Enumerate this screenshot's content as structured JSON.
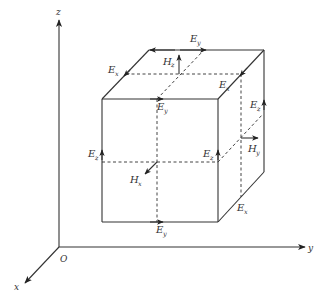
{
  "diagram": {
    "axes": {
      "origin": "O",
      "x": "x",
      "y": "y",
      "z": "z"
    },
    "labels": {
      "top_back_Ey": {
        "main": "E",
        "sub": "y"
      },
      "top_left_Ex": {
        "main": "E",
        "sub": "x"
      },
      "top_Hz": {
        "main": "H",
        "sub": "z"
      },
      "top_right_Ex": {
        "main": "E",
        "sub": "x"
      },
      "front_top_Ey": {
        "main": "E",
        "sub": "y"
      },
      "back_right_Ez": {
        "main": "E",
        "sub": "z"
      },
      "right_Hy": {
        "main": "H",
        "sub": "y"
      },
      "front_left_Ez": {
        "main": "E",
        "sub": "z"
      },
      "front_right_Ez": {
        "main": "E",
        "sub": "z"
      },
      "center_Hx": {
        "main": "H",
        "sub": "x"
      },
      "bottom_right_Ex": {
        "main": "E",
        "sub": "x"
      },
      "front_bottom_Ey": {
        "main": "E",
        "sub": "y"
      }
    },
    "colors": {
      "line": "#333333",
      "background": "#ffffff"
    }
  }
}
